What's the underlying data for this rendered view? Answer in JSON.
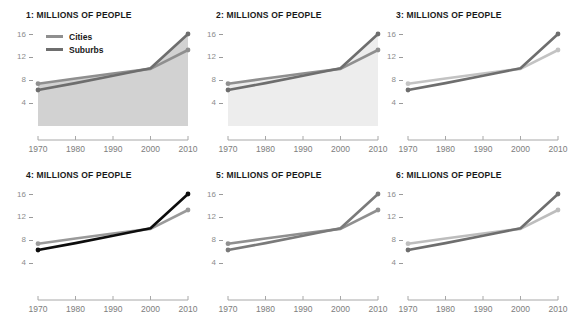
{
  "figure": {
    "panel_count": 6,
    "background": "#ffffff",
    "layout": "2 rows x 3 columns small multiples"
  },
  "legend": {
    "position": "inside panel 1, upper left",
    "entries": [
      {
        "label": "Cities",
        "color": "#8f8f8f"
      },
      {
        "label": "Suburbs",
        "color": "#6e6e6e"
      }
    ]
  },
  "chart_data": [
    {
      "type": "line",
      "title": "1: MILLIONS OF PEOPLE",
      "xlabel": "",
      "ylabel": "",
      "x": [
        1970,
        1980,
        1990,
        2000,
        2010
      ],
      "xticklabels": [
        "1970",
        "1980",
        "1990",
        "2000",
        "2010"
      ],
      "yticks": [
        4,
        8,
        12,
        16
      ],
      "yticklabels": [
        "4",
        "12",
        "8",
        "16"
      ],
      "ylim": [
        0,
        17.5
      ],
      "xlim": [
        1970,
        2010
      ],
      "grid": false,
      "fill": true,
      "fill_color": "#d2d2d2",
      "series": [
        {
          "name": "Cities",
          "values": [
            7.4,
            8.3,
            9.2,
            10.0,
            13.3
          ],
          "color": "#8f8f8f",
          "markers": true
        },
        {
          "name": "Suburbs",
          "values": [
            6.3,
            7.5,
            8.8,
            10.1,
            16.1
          ],
          "color": "#6e6e6e",
          "markers": true
        }
      ]
    },
    {
      "type": "line",
      "title": "2: MILLIONS OF PEOPLE",
      "xlabel": "",
      "ylabel": "",
      "x": [
        1970,
        1980,
        1990,
        2000,
        2010
      ],
      "xticklabels": [
        "1970",
        "1980",
        "1990",
        "2000",
        "2010"
      ],
      "yticks": [
        4,
        8,
        12,
        16
      ],
      "yticklabels": [
        "4",
        "12",
        "8",
        "16"
      ],
      "ylim": [
        0,
        17.5
      ],
      "xlim": [
        1970,
        2010
      ],
      "grid": false,
      "fill": true,
      "fill_color": "#ededed",
      "series": [
        {
          "name": "Cities",
          "values": [
            7.4,
            8.3,
            9.2,
            10.0,
            13.3
          ],
          "color": "#8f8f8f",
          "markers": true
        },
        {
          "name": "Suburbs",
          "values": [
            6.3,
            7.5,
            8.8,
            10.1,
            16.1
          ],
          "color": "#6e6e6e",
          "markers": true
        }
      ]
    },
    {
      "type": "line",
      "title": "3: MILLIONS OF PEOPLE",
      "xlabel": "",
      "ylabel": "",
      "x": [
        1970,
        1980,
        1990,
        2000,
        2010
      ],
      "xticklabels": [
        "1970",
        "1980",
        "1990",
        "2000",
        "2010"
      ],
      "yticks": [
        4,
        8,
        12,
        16
      ],
      "yticklabels": [
        "4",
        "12",
        "8",
        "16"
      ],
      "ylim": [
        0,
        17.5
      ],
      "xlim": [
        1970,
        2010
      ],
      "grid": false,
      "fill": false,
      "fill_color": "none",
      "series": [
        {
          "name": "Cities",
          "values": [
            7.4,
            8.3,
            9.2,
            10.0,
            13.3
          ],
          "color": "#c3c3c3",
          "markers": true
        },
        {
          "name": "Suburbs",
          "values": [
            6.3,
            7.5,
            8.8,
            10.1,
            16.1
          ],
          "color": "#6e6e6e",
          "markers": true
        }
      ]
    },
    {
      "type": "line",
      "title": "4: MILLIONS OF PEOPLE",
      "xlabel": "",
      "ylabel": "",
      "x": [
        1970,
        1980,
        1990,
        2000,
        2010
      ],
      "xticklabels": [
        "1970",
        "1980",
        "1990",
        "2000",
        "2010"
      ],
      "yticks": [
        4,
        8,
        12,
        16
      ],
      "yticklabels": [
        "4",
        "12",
        "8",
        "16"
      ],
      "ylim": [
        0,
        17.5
      ],
      "xlim": [
        1970,
        2010
      ],
      "grid": false,
      "fill": false,
      "fill_color": "none",
      "series": [
        {
          "name": "Cities",
          "values": [
            7.4,
            8.3,
            9.2,
            10.0,
            13.3
          ],
          "color": "#9a9a9a",
          "markers": true
        },
        {
          "name": "Suburbs",
          "values": [
            6.3,
            7.5,
            8.8,
            10.1,
            16.1
          ],
          "color": "#0d0d0d",
          "markers": true
        }
      ]
    },
    {
      "type": "line",
      "title": "5: MILLIONS OF PEOPLE",
      "xlabel": "",
      "ylabel": "",
      "x": [
        1970,
        1980,
        1990,
        2000,
        2010
      ],
      "xticklabels": [
        "1970",
        "1980",
        "1990",
        "2000",
        "2010"
      ],
      "yticks": [
        4,
        8,
        12,
        16
      ],
      "yticklabels": [
        "4",
        "12",
        "8",
        "16"
      ],
      "ylim": [
        0,
        17.5
      ],
      "xlim": [
        1970,
        2010
      ],
      "grid": false,
      "fill": false,
      "fill_color": "none",
      "series": [
        {
          "name": "Cities",
          "values": [
            7.4,
            8.3,
            9.2,
            10.0,
            13.3
          ],
          "color": "#8f8f8f",
          "markers": true
        },
        {
          "name": "Suburbs",
          "values": [
            6.3,
            7.5,
            8.8,
            10.1,
            16.1
          ],
          "color": "#7a7a7a",
          "markers": true
        }
      ]
    },
    {
      "type": "line",
      "title": "6: MILLIONS OF PEOPLE",
      "xlabel": "",
      "ylabel": "",
      "x": [
        1970,
        1980,
        1990,
        2000,
        2010
      ],
      "xticklabels": [
        "1970",
        "1980",
        "1990",
        "2000",
        "2010"
      ],
      "yticks": [
        4,
        8,
        12,
        16
      ],
      "yticklabels": [
        "4",
        "12",
        "8",
        "16"
      ],
      "ylim": [
        0,
        17.5
      ],
      "xlim": [
        1970,
        2010
      ],
      "grid": false,
      "fill": false,
      "fill_color": "none",
      "series": [
        {
          "name": "Cities",
          "values": [
            7.4,
            8.3,
            9.2,
            10.0,
            13.3
          ],
          "color": "#bdbdbd",
          "markers": true
        },
        {
          "name": "Suburbs",
          "values": [
            6.3,
            7.5,
            8.8,
            10.1,
            16.1
          ],
          "color": "#6e6e6e",
          "markers": true
        }
      ]
    }
  ]
}
